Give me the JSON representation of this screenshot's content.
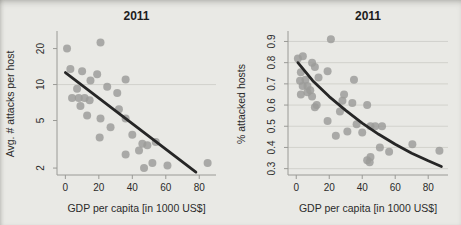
{
  "figure": {
    "background_color": "#e9e9e5",
    "point_color": "#9b9b99",
    "trend_color": "#262626",
    "grid_color": "#cfcfca",
    "axis_color": "#9a9a96"
  },
  "chart_data": [
    {
      "type": "scatter",
      "title": "2011",
      "xlabel": "GDP per capita [in 1000 US$]",
      "ylabel": "Avg. # attacks per host",
      "yscale": "log",
      "xlim": [
        -5,
        90
      ],
      "ylim": [
        1.75,
        27
      ],
      "xticks": [
        0,
        20,
        40,
        60,
        80
      ],
      "yticks": [
        2,
        5,
        10,
        20
      ],
      "gridlines_y": [
        10
      ],
      "grid": "single-line-at-10",
      "legend": "none",
      "points": [
        [
          1,
          20
        ],
        [
          21,
          22.5
        ],
        [
          3,
          13.5
        ],
        [
          10,
          12.9
        ],
        [
          19,
          12.2
        ],
        [
          15,
          10.8
        ],
        [
          36,
          11
        ],
        [
          7,
          9.2
        ],
        [
          4,
          7.7
        ],
        [
          8,
          7.7
        ],
        [
          11.5,
          7.7
        ],
        [
          14.5,
          7.4
        ],
        [
          9,
          6.6
        ],
        [
          25,
          9.6
        ],
        [
          31,
          8.5
        ],
        [
          13,
          5.5
        ],
        [
          21,
          5.2
        ],
        [
          32,
          6.2
        ],
        [
          36,
          5.2
        ],
        [
          27,
          4.4
        ],
        [
          40,
          3.8
        ],
        [
          20.5,
          3.6
        ],
        [
          46,
          3.2
        ],
        [
          49,
          3.1
        ],
        [
          44,
          2.8
        ],
        [
          36,
          2.6
        ],
        [
          54,
          3.3
        ],
        [
          47,
          2.0
        ],
        [
          52,
          2.2
        ],
        [
          61,
          2.1
        ],
        [
          85,
          2.2
        ]
      ],
      "trend": [
        [
          0,
          12.6
        ],
        [
          78,
          1.85
        ]
      ]
    },
    {
      "type": "scatter",
      "title": "2011",
      "xlabel": "GDP per capita [in 1000 US$]",
      "ylabel": "% attacked hosts",
      "yscale": "linear",
      "xlim": [
        -5,
        92
      ],
      "ylim": [
        0.27,
        0.94
      ],
      "xticks": [
        0,
        20,
        40,
        60,
        80
      ],
      "yticks": [
        0.3,
        0.4,
        0.5,
        0.6,
        0.7,
        0.8,
        0.9
      ],
      "gridlines_y": [
        0.3,
        0.4,
        0.5,
        0.6,
        0.7,
        0.8,
        0.9
      ],
      "grid": "horizontal",
      "legend": "none",
      "points": [
        [
          1,
          0.82
        ],
        [
          4,
          0.83
        ],
        [
          2.8,
          0.755
        ],
        [
          2.3,
          0.715
        ],
        [
          2.8,
          0.65
        ],
        [
          3.9,
          0.69
        ],
        [
          5.6,
          0.72
        ],
        [
          6.8,
          0.69
        ],
        [
          6.8,
          0.66
        ],
        [
          8.5,
          0.67
        ],
        [
          9.6,
          0.8
        ],
        [
          9.6,
          0.64
        ],
        [
          11.3,
          0.78
        ],
        [
          11.3,
          0.59
        ],
        [
          12.4,
          0.6
        ],
        [
          13.5,
          0.73
        ],
        [
          19,
          0.76
        ],
        [
          19,
          0.525
        ],
        [
          21,
          0.91
        ],
        [
          24,
          0.455
        ],
        [
          26.5,
          0.57
        ],
        [
          28,
          0.62
        ],
        [
          29,
          0.65
        ],
        [
          31,
          0.475
        ],
        [
          34,
          0.61
        ],
        [
          35,
          0.72
        ],
        [
          36.6,
          0.51
        ],
        [
          40,
          0.47
        ],
        [
          43,
          0.6
        ],
        [
          43,
          0.34
        ],
        [
          44.5,
          0.33
        ],
        [
          45,
          0.5
        ],
        [
          45,
          0.355
        ],
        [
          47.9,
          0.5
        ],
        [
          50.7,
          0.4
        ],
        [
          52,
          0.5
        ],
        [
          56.3,
          0.38
        ],
        [
          70.4,
          0.415
        ],
        [
          86.8,
          0.385
        ]
      ],
      "trend": [
        [
          1,
          0.8
        ],
        [
          10,
          0.715
        ],
        [
          20,
          0.64
        ],
        [
          30,
          0.575
        ],
        [
          40,
          0.515
        ],
        [
          50,
          0.462
        ],
        [
          60,
          0.415
        ],
        [
          70,
          0.373
        ],
        [
          80,
          0.337
        ],
        [
          88,
          0.31
        ]
      ]
    }
  ]
}
